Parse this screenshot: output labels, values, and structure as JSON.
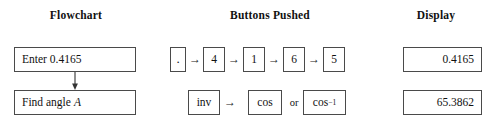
{
  "headers": {
    "flowchart": "Flowchart",
    "buttons": "Buttons Pushed",
    "display": "Display"
  },
  "flowchart": {
    "steps": [
      {
        "text": "Enter 0.4165",
        "italic_suffix": ""
      },
      {
        "text": "Find angle",
        "italic_suffix": "A"
      }
    ],
    "connector": "down-arrow"
  },
  "buttons": {
    "row1": {
      "keys": [
        ".",
        "4",
        "1",
        "6",
        "5"
      ],
      "separator": "→"
    },
    "row2": {
      "first_key": "inv",
      "separator": "→",
      "second_key": "cos",
      "alternative_label": "or",
      "alternative_key_base": "cos",
      "alternative_key_exponent": "−1"
    }
  },
  "display": {
    "values": [
      "0.4165",
      "65.3862"
    ]
  },
  "colors": {
    "background": "#ffffff",
    "text": "#111111",
    "border": "#4a4a4a"
  }
}
